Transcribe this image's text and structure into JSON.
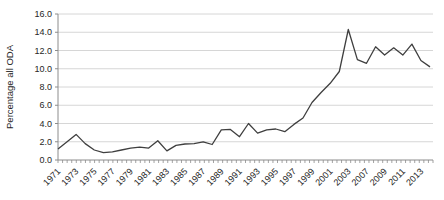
{
  "chart_data": {
    "type": "line",
    "title": "",
    "xlabel": "",
    "ylabel": "Percentage all ODA",
    "ylim": [
      0,
      16
    ],
    "ytick_step": 2.0,
    "grid": "horizontal-only",
    "legend": "none",
    "line_color": "#3f3f3f",
    "grid_color": "#cccccc",
    "axis_color": "#8c8c8c",
    "text_color": "#262626",
    "y_tick_labels": [
      "0.0",
      "2.0",
      "4.0",
      "6.0",
      "8.0",
      "10.0",
      "12.0",
      "14.0",
      "16.0"
    ],
    "x_tick_labels": [
      "1971",
      "1973",
      "1975",
      "1977",
      "1979",
      "1981",
      "1983",
      "1985",
      "1987",
      "1989",
      "1991",
      "1993",
      "1995",
      "1997",
      "1999",
      "2001",
      "2003",
      "2007",
      "2009",
      "2011",
      "2013"
    ],
    "categories": [
      "1971",
      "1972",
      "1973",
      "1974",
      "1975",
      "1976",
      "1977",
      "1978",
      "1979",
      "1980",
      "1981",
      "1982",
      "1983",
      "1984",
      "1985",
      "1986",
      "1987",
      "1988",
      "1989",
      "1990",
      "1991",
      "1992",
      "1993",
      "1994",
      "1995",
      "1996",
      "1997",
      "1998",
      "1999",
      "2000",
      "2001",
      "2002",
      "2003",
      "2004",
      "2006",
      "2007",
      "2008",
      "2009",
      "2010",
      "2011",
      "2012",
      "2013"
    ],
    "values": [
      1.2,
      2.0,
      2.8,
      1.8,
      1.1,
      0.8,
      0.9,
      1.1,
      1.3,
      1.4,
      1.3,
      2.1,
      1.0,
      1.6,
      1.75,
      1.8,
      2.0,
      1.7,
      3.3,
      3.35,
      2.55,
      4.0,
      2.95,
      3.3,
      3.4,
      3.1,
      3.9,
      4.6,
      6.3,
      7.4,
      8.4,
      9.7,
      14.3,
      11.0,
      10.6,
      12.4,
      11.5,
      12.3,
      11.5,
      12.7,
      10.9,
      10.2
    ]
  }
}
